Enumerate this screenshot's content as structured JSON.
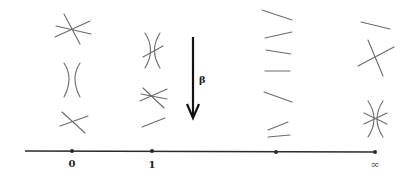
{
  "diagram": {
    "axis": {
      "points": [
        {
          "id": "p0",
          "label": "0"
        },
        {
          "id": "p1",
          "label": "1"
        },
        {
          "id": "p2",
          "label": ""
        },
        {
          "id": "pinf",
          "label": "∞"
        }
      ]
    },
    "arrow": {
      "label": "β",
      "direction": "down"
    },
    "columns": [
      {
        "point": "0",
        "configurations": [
          "three-concurrent-lines",
          "two-tangent-conics",
          "two-crossing-lines"
        ]
      },
      {
        "point": "1",
        "configurations": [
          "tangent-conics-with-transversal",
          "three-lines-near-concurrent",
          "single-line"
        ]
      },
      {
        "point": "",
        "configurations": [
          "line",
          "line",
          "line",
          "line",
          "line",
          "line",
          "line"
        ]
      },
      {
        "point": "∞",
        "configurations": [
          "single-line",
          "two-crossing-lines",
          "tangent-conics-with-two-lines"
        ]
      }
    ],
    "colors": {
      "curve": "#6b6b6b",
      "axis": "#2a2a2a",
      "arrow": "#111111"
    }
  }
}
